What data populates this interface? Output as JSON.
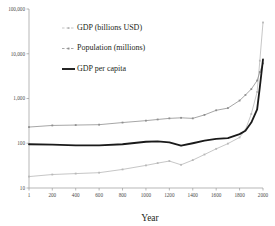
{
  "chart_data": {
    "type": "line",
    "title": "",
    "xlabel": "Year",
    "ylabel": "",
    "scale": "log",
    "xlim": [
      1,
      2000
    ],
    "ylim": [
      10,
      100000
    ],
    "grid": false,
    "legend_position": "upper-left-inside",
    "xticks": [
      1,
      200,
      400,
      600,
      800,
      1000,
      1200,
      1400,
      1600,
      1800,
      2000
    ],
    "xtick_labels": [
      "1",
      "200",
      "400",
      "600",
      "800",
      "1000",
      "1200",
      "1400",
      "1600",
      "1800",
      "2000"
    ],
    "yticks": [
      10,
      100,
      1000,
      10000,
      100000
    ],
    "ytick_labels": [
      "10",
      "100",
      "1,000",
      "10,000",
      "100,000"
    ],
    "series": [
      {
        "name": "GDP (billions USD)",
        "color": "#b8b8b8",
        "marker": "square",
        "width": 0.8,
        "x": [
          1,
          200,
          400,
          600,
          800,
          1000,
          1100,
          1200,
          1300,
          1400,
          1500,
          1600,
          1700,
          1800,
          1850,
          1900,
          1950,
          1973,
          2000
        ],
        "values": [
          18,
          20,
          21,
          22,
          26,
          32,
          36,
          40,
          33,
          42,
          56,
          75,
          98,
          135,
          200,
          450,
          1400,
          7000,
          50000
        ]
      },
      {
        "name": "Population (millions)",
        "color": "#8f8f8f",
        "marker": "square",
        "width": 0.8,
        "x": [
          1,
          200,
          400,
          600,
          800,
          1000,
          1100,
          1200,
          1300,
          1400,
          1500,
          1600,
          1700,
          1800,
          1850,
          1900,
          1950,
          1973,
          2000
        ],
        "values": [
          230,
          250,
          255,
          260,
          290,
          320,
          340,
          360,
          370,
          360,
          430,
          545,
          610,
          900,
          1200,
          1620,
          2520,
          3900,
          6100
        ]
      },
      {
        "name": "GDP per capita",
        "color": "#1a1a1a",
        "marker": "none",
        "width": 1.8,
        "x": [
          1,
          200,
          400,
          600,
          800,
          1000,
          1100,
          1200,
          1300,
          1400,
          1500,
          1600,
          1700,
          1800,
          1850,
          1900,
          1950,
          1973,
          2000
        ],
        "values": [
          95,
          93,
          90,
          90,
          95,
          108,
          110,
          105,
          88,
          100,
          115,
          125,
          130,
          160,
          190,
          290,
          570,
          1800,
          7500
        ]
      }
    ]
  },
  "legend": {
    "items": [
      {
        "label": "GDP (billions USD)"
      },
      {
        "label": "Population (millions)"
      },
      {
        "label": "GDP per capita"
      }
    ]
  },
  "axis": {
    "x_title": "Year"
  }
}
